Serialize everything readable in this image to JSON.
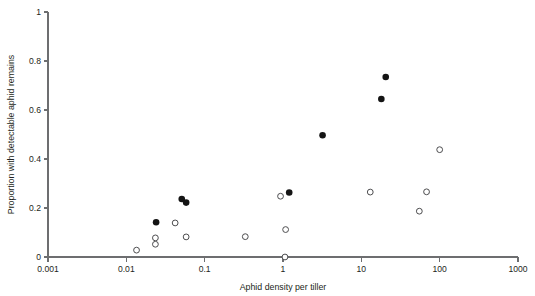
{
  "chart_data": {
    "type": "scatter",
    "title": "",
    "xlabel": "Aphid density per tiller",
    "ylabel": "Proportion with detectable aphid remains",
    "xscale": "log",
    "yscale": "linear",
    "xlim": [
      0.001,
      1000
    ],
    "ylim": [
      0,
      1
    ],
    "grid": false,
    "legend": "none",
    "xticks": [
      "0.001",
      "0.01",
      "0.1",
      "1",
      "10",
      "100",
      "1000"
    ],
    "xtick_values": [
      0.001,
      0.01,
      0.1,
      1,
      10,
      100,
      1000
    ],
    "yticks": [
      "0",
      "0.2",
      "0.4",
      "0.6",
      "0.8",
      "1"
    ],
    "ytick_values": [
      0,
      0.2,
      0.4,
      0.6,
      0.8,
      1
    ],
    "series": [
      {
        "name": "filled",
        "marker": "filled-circle",
        "color": "#141414",
        "points": [
          {
            "x": 0.024,
            "y": 0.142
          },
          {
            "x": 0.051,
            "y": 0.237
          },
          {
            "x": 0.058,
            "y": 0.222
          },
          {
            "x": 1.2,
            "y": 0.263
          },
          {
            "x": 3.2,
            "y": 0.497
          },
          {
            "x": 18.0,
            "y": 0.645
          },
          {
            "x": 20.5,
            "y": 0.735
          }
        ]
      },
      {
        "name": "open",
        "marker": "open-circle",
        "color": "#4d4d4f",
        "points": [
          {
            "x": 0.0135,
            "y": 0.028
          },
          {
            "x": 0.0235,
            "y": 0.078
          },
          {
            "x": 0.0235,
            "y": 0.052
          },
          {
            "x": 0.042,
            "y": 0.139
          },
          {
            "x": 0.058,
            "y": 0.082
          },
          {
            "x": 0.33,
            "y": 0.083
          },
          {
            "x": 0.93,
            "y": 0.248
          },
          {
            "x": 1.08,
            "y": 0.112
          },
          {
            "x": 1.06,
            "y": 0.0
          },
          {
            "x": 13.0,
            "y": 0.265
          },
          {
            "x": 55.0,
            "y": 0.187
          },
          {
            "x": 68.0,
            "y": 0.266
          },
          {
            "x": 100.0,
            "y": 0.438
          }
        ]
      }
    ]
  }
}
